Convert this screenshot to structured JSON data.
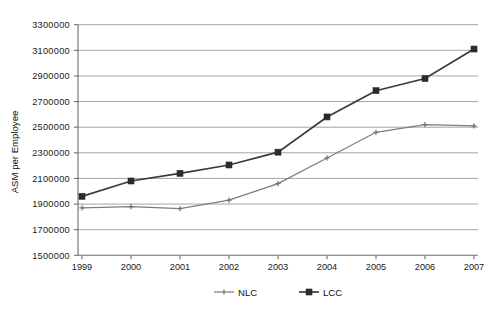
{
  "chart_data": {
    "type": "line",
    "title": "",
    "xlabel": "",
    "ylabel": "ASM per Employee",
    "categories": [
      "1999",
      "2000",
      "2001",
      "2002",
      "2003",
      "2004",
      "2005",
      "2006",
      "2007"
    ],
    "x": [
      1999,
      2000,
      2001,
      2002,
      2003,
      2004,
      2005,
      2006,
      2007
    ],
    "ylim": [
      1500000,
      3300000
    ],
    "ytick_step": 200000,
    "ytick_labels": [
      "3300000",
      "3100000",
      "2900000",
      "2700000",
      "2500000",
      "2300000",
      "2100000",
      "1900000",
      "1700000",
      "1500000"
    ],
    "ytick_values": [
      3300000,
      3100000,
      2900000,
      2700000,
      2500000,
      2300000,
      2100000,
      1900000,
      1700000,
      1500000
    ],
    "grid": true,
    "grid_axis": "y",
    "legend_position": "bottom",
    "series": [
      {
        "name": "NLC",
        "marker": "plus",
        "color": "#7d7d7d",
        "values": [
          1870000,
          1880000,
          1865000,
          1930000,
          2060000,
          2260000,
          2460000,
          2520000,
          2510000
        ]
      },
      {
        "name": "LCC",
        "marker": "square",
        "color": "#2b2b2b",
        "values": [
          1960000,
          2080000,
          2140000,
          2205000,
          2305000,
          2580000,
          2785000,
          2880000,
          3110000
        ]
      }
    ]
  },
  "legend": {
    "items": [
      {
        "label": "NLC"
      },
      {
        "label": "LCC"
      }
    ]
  },
  "colors": {
    "nlc": "#7d7d7d",
    "lcc": "#2b2b2b",
    "axis": "#6e6e6e",
    "grid": "#9a9a9a",
    "background": "#ffffff"
  }
}
